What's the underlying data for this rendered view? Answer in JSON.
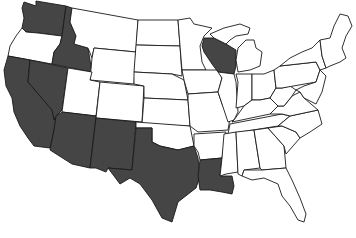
{
  "map": {
    "title": "United States",
    "highlight_color": "#454545",
    "base_color": "#ffffff",
    "border_color": "#1a1a1a",
    "highlighted_states": [
      "Washington",
      "Idaho",
      "California",
      "Nevada",
      "Arizona",
      "New Mexico",
      "Texas",
      "Louisiana",
      "Wisconsin"
    ],
    "states": [
      {
        "id": "WA",
        "name": "Washington",
        "highlighted": true
      },
      {
        "id": "OR",
        "name": "Oregon",
        "highlighted": false
      },
      {
        "id": "CA",
        "name": "California",
        "highlighted": true
      },
      {
        "id": "ID",
        "name": "Idaho",
        "highlighted": true
      },
      {
        "id": "NV",
        "name": "Nevada",
        "highlighted": true
      },
      {
        "id": "MT",
        "name": "Montana",
        "highlighted": false
      },
      {
        "id": "WY",
        "name": "Wyoming",
        "highlighted": false
      },
      {
        "id": "UT",
        "name": "Utah",
        "highlighted": false
      },
      {
        "id": "AZ",
        "name": "Arizona",
        "highlighted": true
      },
      {
        "id": "CO",
        "name": "Colorado",
        "highlighted": false
      },
      {
        "id": "NM",
        "name": "New Mexico",
        "highlighted": true
      },
      {
        "id": "ND",
        "name": "North Dakota",
        "highlighted": false
      },
      {
        "id": "SD",
        "name": "South Dakota",
        "highlighted": false
      },
      {
        "id": "NE",
        "name": "Nebraska",
        "highlighted": false
      },
      {
        "id": "KS",
        "name": "Kansas",
        "highlighted": false
      },
      {
        "id": "OK",
        "name": "Oklahoma",
        "highlighted": false
      },
      {
        "id": "TX",
        "name": "Texas",
        "highlighted": true
      },
      {
        "id": "MN",
        "name": "Minnesota",
        "highlighted": false
      },
      {
        "id": "IA",
        "name": "Iowa",
        "highlighted": false
      },
      {
        "id": "MO",
        "name": "Missouri",
        "highlighted": false
      },
      {
        "id": "AR",
        "name": "Arkansas",
        "highlighted": false
      },
      {
        "id": "LA",
        "name": "Louisiana",
        "highlighted": true
      },
      {
        "id": "WI",
        "name": "Wisconsin",
        "highlighted": true
      },
      {
        "id": "IL",
        "name": "Illinois",
        "highlighted": false
      },
      {
        "id": "MI",
        "name": "Michigan",
        "highlighted": false
      },
      {
        "id": "IN",
        "name": "Indiana",
        "highlighted": false
      },
      {
        "id": "OH",
        "name": "Ohio",
        "highlighted": false
      },
      {
        "id": "KY",
        "name": "Kentucky",
        "highlighted": false
      },
      {
        "id": "TN",
        "name": "Tennessee",
        "highlighted": false
      },
      {
        "id": "MS",
        "name": "Mississippi",
        "highlighted": false
      },
      {
        "id": "AL",
        "name": "Alabama",
        "highlighted": false
      },
      {
        "id": "GA",
        "name": "Georgia",
        "highlighted": false
      },
      {
        "id": "FL",
        "name": "Florida",
        "highlighted": false
      },
      {
        "id": "SC",
        "name": "South Carolina",
        "highlighted": false
      },
      {
        "id": "NC",
        "name": "North Carolina",
        "highlighted": false
      },
      {
        "id": "VA",
        "name": "Virginia",
        "highlighted": false
      },
      {
        "id": "WV",
        "name": "West Virginia",
        "highlighted": false
      },
      {
        "id": "PA",
        "name": "Pennsylvania",
        "highlighted": false
      },
      {
        "id": "NY",
        "name": "New York",
        "highlighted": false
      },
      {
        "id": "NE_ENGLAND",
        "name": "New England",
        "highlighted": false
      },
      {
        "id": "MD",
        "name": "Maryland/Delaware/New Jersey",
        "highlighted": false
      }
    ]
  }
}
